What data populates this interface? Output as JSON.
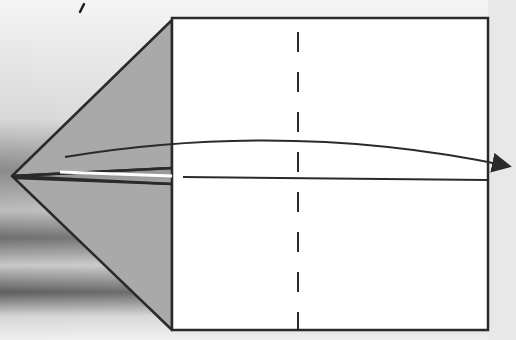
{
  "diagram": {
    "colors": {
      "background_light": "#efefef",
      "background_dark_streak": "#6e6e6e",
      "paper": "#ffffff",
      "folded_flap": "#a9a9a9",
      "ink": "#2a2a2a"
    },
    "elements": {
      "paper_rect": {
        "x": 172,
        "y": 18,
        "width": 316,
        "height": 312
      },
      "dashed_fold_line_x": 298,
      "center_crease_y": 178,
      "triangle_tip": {
        "x": 12,
        "y": 176
      },
      "arrow": {
        "from": [
          65,
          157
        ],
        "to": [
          516,
          168
        ],
        "direction": "right"
      }
    }
  }
}
